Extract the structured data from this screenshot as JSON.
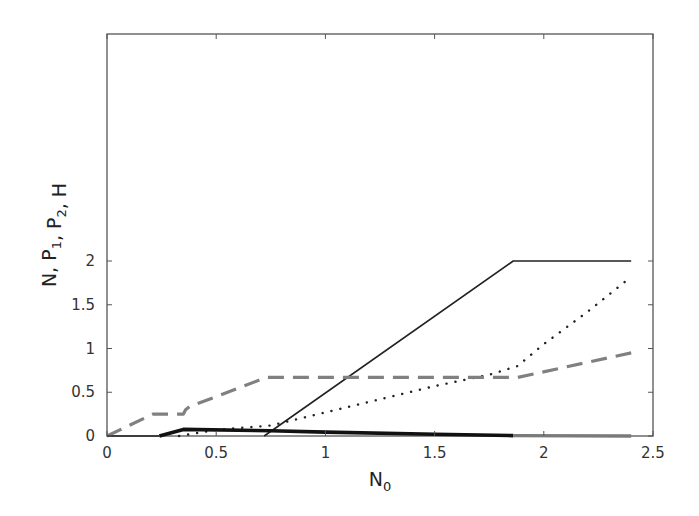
{
  "chart_data": {
    "type": "line",
    "title": "",
    "xlabel": "N0",
    "xlabel_main": "N",
    "xlabel_sub": "0",
    "ylabel": "N, P1, P2, H",
    "ylabel_parts": [
      {
        "t": "N, P",
        "sub": "1"
      },
      {
        "t": ", P",
        "sub": "2"
      },
      {
        "t": ", H",
        "sub": ""
      }
    ],
    "xlim": [
      0,
      2.5
    ],
    "ylim": [
      0,
      2.3
    ],
    "xticks": [
      0,
      0.5,
      1,
      1.5,
      2,
      2.5
    ],
    "xtick_labels": [
      "0",
      "0.5",
      "1",
      "1.5",
      "2",
      "2.5"
    ],
    "yticks": [
      0,
      0.5,
      1,
      1.5,
      2
    ],
    "ytick_labels": [
      "0",
      "0.5",
      "1",
      "1.5",
      "2"
    ],
    "grid": false,
    "legend": null,
    "series": [
      {
        "name": "thin solid (black)",
        "style": "solid",
        "color": "#222222",
        "width": 1.6,
        "x": [
          0.72,
          1.86,
          2.4
        ],
        "y": [
          0,
          2.0,
          2.0
        ]
      },
      {
        "name": "dotted (black)",
        "style": "dotted",
        "color": "#222222",
        "width": 2.4,
        "x": [
          0.33,
          0.5,
          0.75,
          1.0,
          1.25,
          1.5,
          1.75,
          1.88,
          2.0,
          2.2,
          2.4
        ],
        "y": [
          0,
          0.07,
          0.12,
          0.27,
          0.42,
          0.57,
          0.7,
          0.8,
          1.05,
          1.42,
          1.82
        ]
      },
      {
        "name": "dashed (gray)",
        "style": "dashed",
        "color": "#808080",
        "width": 3.2,
        "x": [
          0,
          0.21,
          0.35,
          0.36,
          0.38,
          0.5,
          0.73,
          1.0,
          1.5,
          1.88,
          2.4
        ],
        "y": [
          0,
          0.25,
          0.25,
          0.3,
          0.34,
          0.45,
          0.67,
          0.67,
          0.67,
          0.67,
          0.95
        ]
      },
      {
        "name": "thick solid (black)",
        "style": "solid",
        "color": "#111111",
        "width": 3.6,
        "x": [
          0.24,
          0.35,
          0.75,
          1.0,
          1.5,
          1.86
        ],
        "y": [
          0,
          0.075,
          0.06,
          0.045,
          0.02,
          0.005
        ]
      },
      {
        "name": "thick solid (gray)",
        "style": "solid",
        "color": "#7a7a7a",
        "width": 3.4,
        "x": [
          1.86,
          2.4
        ],
        "y": [
          0.005,
          0.0
        ]
      },
      {
        "name": "baseline zero (black)",
        "style": "solid",
        "color": "#222222",
        "width": 1.6,
        "x": [
          0,
          0.24
        ],
        "y": [
          0,
          0
        ]
      }
    ]
  },
  "layout": {
    "plot_left": 107,
    "plot_right": 653,
    "plot_top": 34,
    "plot_bottom": 436,
    "x0_px": 107,
    "x_per_unit": 218.4,
    "y0_px": 436,
    "y_per_unit": 87.5
  }
}
